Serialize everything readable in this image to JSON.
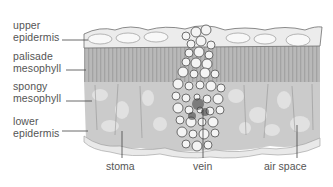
{
  "diagram": {
    "left_labels": [
      {
        "line1": "upper",
        "line2": "epidermis"
      },
      {
        "line1": "palisade",
        "line2": "mesophyll"
      },
      {
        "line1": "spongy",
        "line2": "mesophyll"
      },
      {
        "line1": "lower",
        "line2": "epidermis"
      }
    ],
    "bottom_labels": [
      {
        "text": "stoma"
      },
      {
        "text": "vein"
      },
      {
        "text": "air space"
      }
    ],
    "colors": {
      "text": "#555555",
      "leader_line": "#444444",
      "palisade": "#b4b4b4",
      "spongy": "#c8c8c8",
      "epidermis": "#e6e6e6",
      "vein_cells": "#f0f0f0",
      "cell_outline": "#6a6a6a"
    }
  }
}
